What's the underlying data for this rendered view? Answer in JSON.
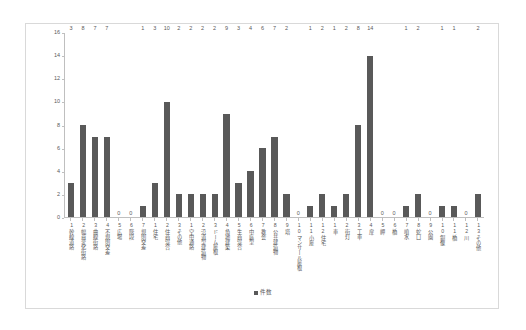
{
  "chart_data": {
    "type": "bar",
    "title": "",
    "xlabel": "",
    "ylabel": "",
    "ylim": [
      0,
      16
    ],
    "ytick_step": 2,
    "yticks": [
      16,
      14,
      12,
      10,
      8,
      6,
      4,
      2,
      0
    ],
    "grid": false,
    "legend_position": "bottom",
    "legend": [
      "件数"
    ],
    "series_name": "件数",
    "bar_color": "#595959",
    "categories": [
      "幹線道路",
      "幅員変化街路",
      "曲線街路",
      "不規則交差",
      "広場",
      "階段",
      "規則交差",
      "住宅",
      "住商混合",
      "その他",
      "空中通路",
      "沿道型建造物",
      "ドーム屋根",
      "角地建築",
      "生商混合",
      "中庭型",
      "教会",
      "公共建造物",
      "塔",
      "マンサール屋根",
      "小屋",
      "住宅",
      "車",
      "街灯",
      "工車",
      "扉",
      "岬",
      "橋",
      "噴水",
      "蛇口",
      "公園",
      "銅像",
      "橋",
      "川",
      "その他"
    ],
    "category_numbers": [
      "1",
      "2",
      "3",
      "4",
      "5",
      "6",
      "7",
      "1",
      "2",
      "3",
      "1",
      "2",
      "3",
      "4",
      "5",
      "6",
      "7",
      "8",
      "9",
      "10",
      "11",
      "12",
      "1",
      "2",
      "3",
      "4",
      "5",
      "6",
      "7",
      "8",
      "9",
      "10",
      "11",
      "12",
      "13"
    ],
    "values": [
      3,
      8,
      7,
      7,
      0,
      0,
      1,
      3,
      10,
      2,
      2,
      2,
      2,
      9,
      3,
      4,
      6,
      7,
      2,
      0,
      1,
      2,
      1,
      2,
      8,
      14,
      0,
      0,
      1,
      2,
      0,
      1,
      1,
      0,
      2
    ]
  }
}
